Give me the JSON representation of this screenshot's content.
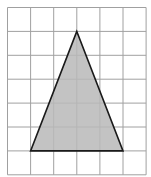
{
  "diagram": {
    "type": "triangle-on-grid",
    "grid": {
      "columns": 6,
      "rows": 7,
      "line_color": "#a0a0a0"
    },
    "triangle": {
      "vertices": [
        [
          3,
          1
        ],
        [
          1,
          6
        ],
        [
          5,
          6
        ]
      ],
      "fill": "#b8b8b8",
      "stroke": "#1a1a1a"
    }
  }
}
